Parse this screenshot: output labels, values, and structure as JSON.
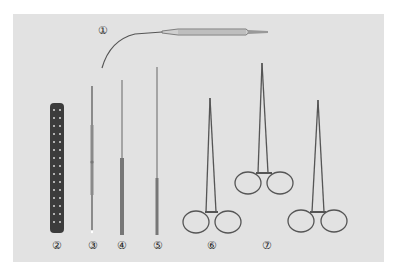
{
  "figure": {
    "background_color": "#e2e2e2",
    "instrument_color": "#555555",
    "labels": [
      "①",
      "②",
      "③",
      "④",
      "⑤",
      "⑥",
      "⑦"
    ],
    "instruments": [
      {
        "number": "①",
        "name": "curved-probe-handle"
      },
      {
        "number": "②",
        "name": "perforated-plate"
      },
      {
        "number": "③",
        "name": "dissector"
      },
      {
        "number": "④",
        "name": "needle-probe"
      },
      {
        "number": "⑤",
        "name": "fine-needle"
      },
      {
        "number": "⑥",
        "name": "needle-holder"
      },
      {
        "number": "⑦",
        "name": "hemostatic-forceps-pair"
      }
    ]
  }
}
